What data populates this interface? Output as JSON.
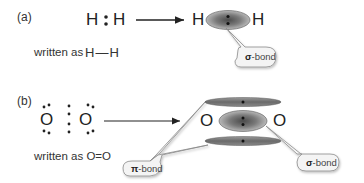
{
  "part_a": {
    "label": "(a)",
    "lewis": {
      "left_atom": "H",
      "right_atom": "H"
    },
    "written_as_prefix": "written as",
    "written_as_formula": "H—H",
    "result": {
      "left_atom": "H",
      "right_atom": "H"
    },
    "callout": {
      "symbol": "σ",
      "text": "-bond"
    }
  },
  "part_b": {
    "label": "(b)",
    "lewis": {
      "left_atom": "O",
      "right_atom": "O"
    },
    "written_as": "written as O=O",
    "result": {
      "left_atom": "O",
      "right_atom": "O"
    },
    "callout_pi": {
      "symbol": "π",
      "text": "-bond"
    },
    "callout_sigma": {
      "symbol": "σ",
      "text": "-bond"
    }
  },
  "colors": {
    "orbital_dark": "#6e6e6e",
    "orbital_light": "#b5b5b5",
    "callout_fill": "#f4f4f4",
    "callout_stroke": "#8a8a8a",
    "text": "#222222"
  }
}
